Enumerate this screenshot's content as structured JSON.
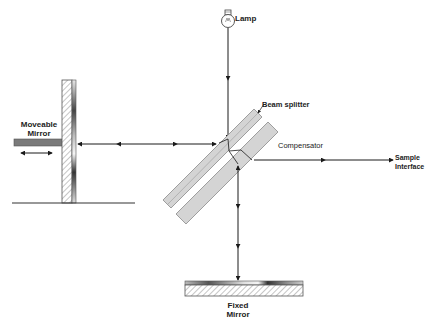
{
  "diagram": {
    "type": "Michelson interferometer schematic",
    "labels": {
      "lamp": "Lamp",
      "beam_splitter": "Beam splitter",
      "compensator": "Compensator",
      "moveable_mirror_line1": "Moveable",
      "moveable_mirror_line2": "Mirror",
      "sample_interface_line1": "Sample",
      "sample_interface_line2": "Interface",
      "fixed_mirror_line1": "Fixed",
      "fixed_mirror_line2": "Mirror"
    },
    "components": [
      {
        "id": "lamp",
        "label": "Lamp"
      },
      {
        "id": "beam-splitter",
        "label": "Beam splitter"
      },
      {
        "id": "compensator",
        "label": "Compensator"
      },
      {
        "id": "moveable-mirror",
        "label": "Moveable Mirror"
      },
      {
        "id": "fixed-mirror",
        "label": "Fixed Mirror"
      },
      {
        "id": "sample-interface",
        "label": "Sample Interface"
      }
    ],
    "colors": {
      "line": "#1a1a1a",
      "plate_fill": "#d4d4d4",
      "plate_stroke": "#8a8a8a",
      "rod_fill": "#7a7a7a",
      "hatch": "#9a9a9a"
    }
  }
}
